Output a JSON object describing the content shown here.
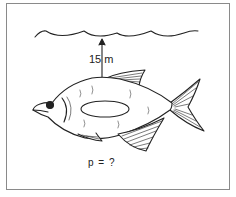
{
  "figure": {
    "depth_label": "15 m",
    "question_label": "p = ?",
    "colors": {
      "ink": "#222222",
      "frame": "#8a8a8a",
      "background": "#ffffff"
    }
  },
  "elements": {
    "water_surface": "wavy-line",
    "depth_arrow": "double-headed-arrow",
    "fish": "fish-illustration",
    "area_marker": "ellipse"
  }
}
